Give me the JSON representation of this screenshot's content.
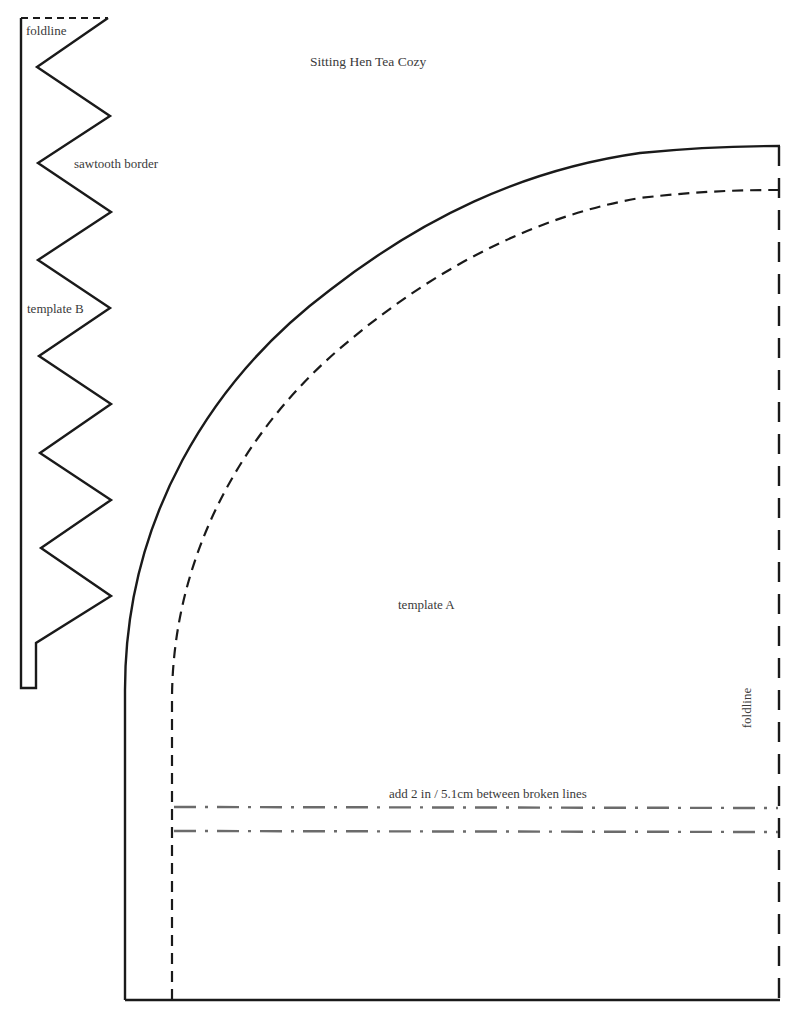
{
  "page": {
    "title": "Sitting Hen Tea Cozy"
  },
  "template_b": {
    "name": "template B",
    "foldline_label": "foldline",
    "border_label": "sawtooth border"
  },
  "template_a": {
    "name": "template A",
    "foldline_label": "foldline",
    "extension_note": "add 2 in / 5.1cm between broken lines"
  },
  "colors": {
    "line": "#1a1a1a",
    "dash_dot": "#6b6b6b",
    "text": "#3a3a3a"
  }
}
